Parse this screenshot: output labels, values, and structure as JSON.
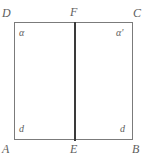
{
  "figure": {
    "background_color": "#ffffff",
    "outline_color": "#7b7b7b",
    "median_color": "#3a3a3a",
    "label_color": "#5e5e5e",
    "vertices": [
      {
        "id": "D",
        "label": "D",
        "position": "top-left"
      },
      {
        "id": "F",
        "label": "F",
        "position": "top-middle"
      },
      {
        "id": "C",
        "label": "C",
        "position": "top-right"
      },
      {
        "id": "A",
        "label": "A",
        "position": "bottom-left"
      },
      {
        "id": "E",
        "label": "E",
        "position": "bottom-middle"
      },
      {
        "id": "B",
        "label": "B",
        "position": "bottom-right"
      }
    ],
    "angle_labels": [
      {
        "id": "alpha",
        "label": "α",
        "at": "D"
      },
      {
        "id": "alpha-prime",
        "label": "α'",
        "at": "C"
      },
      {
        "id": "d-left",
        "label": "d",
        "at": "A"
      },
      {
        "id": "d-right",
        "label": "d",
        "at": "B"
      }
    ],
    "segments": [
      {
        "id": "DC",
        "from": "D",
        "to": "C"
      },
      {
        "id": "AB",
        "from": "A",
        "to": "B"
      },
      {
        "id": "DA",
        "from": "D",
        "to": "A"
      },
      {
        "id": "CB",
        "from": "C",
        "to": "B"
      },
      {
        "id": "FE",
        "from": "F",
        "to": "E"
      }
    ]
  }
}
